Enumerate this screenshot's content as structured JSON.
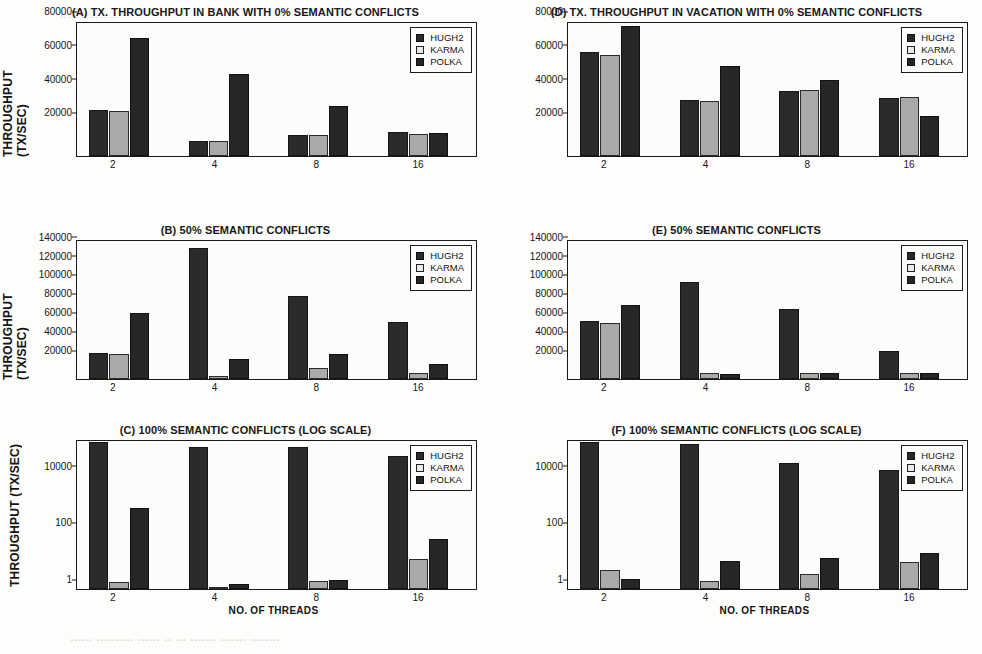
{
  "figure": {
    "series_names": [
      "HUGH2",
      "KARMA",
      "POLKA"
    ],
    "colors": {
      "hugh2": "#2b2b2b",
      "karma": "#a9a9a9",
      "polka": "#262626"
    },
    "x_axis_title": "NO. OF THREADS",
    "y_axis_title": "THROUGHPUT (TX/SEC)",
    "categories": [
      "2",
      "4",
      "8",
      "16"
    ]
  },
  "artifacts": {
    "top_left": "i. ....v. ... .. ...",
    "top_right": ".. ....... ........ ... ...",
    "bottom": "...... .......... ...... .. ... ....... ....... ........"
  },
  "chart_data": [
    {
      "id": "A",
      "type": "bar",
      "title": "(A) TX. THROUGHPUT IN BANK WITH 0% SEMANTIC CONFLICTS",
      "xlabel": "",
      "ylabel": "THROUGHPUT (TX/SEC)",
      "categories": [
        "2",
        "4",
        "8",
        "16"
      ],
      "yticks": [
        20000,
        40000,
        60000,
        80000
      ],
      "ytick_labels": [
        "20000",
        "40000",
        "60000",
        "80000"
      ],
      "ylim": [
        0,
        80000
      ],
      "scale": "linear",
      "grid": false,
      "legend": [
        "HUGH2",
        "KARMA",
        "POLKA"
      ],
      "legend_position": "top-right",
      "series": [
        {
          "name": "HUGH2",
          "values": [
            27500,
            8800,
            12500,
            14500
          ]
        },
        {
          "name": "KARMA",
          "values": [
            27300,
            8800,
            12700,
            13200
          ]
        },
        {
          "name": "POLKA",
          "values": [
            71000,
            49500,
            30000,
            13800
          ]
        }
      ]
    },
    {
      "id": "D",
      "type": "bar",
      "title": "(D) TX. THROUGHPUT IN VACATION WITH 0% SEMANTIC CONFLICTS",
      "xlabel": "",
      "ylabel": "",
      "categories": [
        "2",
        "4",
        "8",
        "16"
      ],
      "yticks": [
        20000,
        40000,
        60000,
        80000
      ],
      "ytick_labels": [
        "20000",
        "40000",
        "60000",
        "80000"
      ],
      "ylim": [
        0,
        80000
      ],
      "scale": "linear",
      "grid": false,
      "legend": [
        "HUGH2",
        "KARMA",
        "POLKA"
      ],
      "legend_position": "top-right",
      "series": [
        {
          "name": "HUGH2",
          "values": [
            62500,
            33500,
            39000,
            34800
          ]
        },
        {
          "name": "KARMA",
          "values": [
            60500,
            33000,
            40000,
            35200
          ]
        },
        {
          "name": "POLKA",
          "values": [
            78500,
            54000,
            45500,
            24000
          ]
        }
      ]
    },
    {
      "id": "B",
      "type": "bar",
      "title": "(B) 50% SEMANTIC CONFLICTS",
      "xlabel": "",
      "ylabel": "THROUGHPUT (TX/SEC)",
      "categories": [
        "2",
        "4",
        "8",
        "16"
      ],
      "yticks": [
        20000,
        40000,
        60000,
        80000,
        100000,
        120000,
        140000
      ],
      "ytick_labels": [
        "20000",
        "40000",
        "60000",
        "80000",
        "100000",
        "120000",
        "140000"
      ],
      "ylim": [
        0,
        148000
      ],
      "scale": "linear",
      "grid": false,
      "legend": [
        "HUGH2",
        "KARMA",
        "POLKA"
      ],
      "legend_position": "top-right",
      "series": [
        {
          "name": "HUGH2",
          "values": [
            27500,
            141000,
            88500,
            61500
          ]
        },
        {
          "name": "KARMA",
          "values": [
            26500,
            3500,
            11500,
            6500
          ]
        },
        {
          "name": "POLKA",
          "values": [
            70500,
            21000,
            26500,
            16000
          ]
        }
      ]
    },
    {
      "id": "E",
      "type": "bar",
      "title": "(E) 50% SEMANTIC CONFLICTS",
      "xlabel": "",
      "ylabel": "",
      "categories": [
        "2",
        "4",
        "8",
        "16"
      ],
      "yticks": [
        20000,
        40000,
        60000,
        80000,
        100000,
        120000,
        140000
      ],
      "ytick_labels": [
        "20000",
        "40000",
        "60000",
        "80000",
        "100000",
        "120000",
        "140000"
      ],
      "ylim": [
        0,
        148000
      ],
      "scale": "linear",
      "grid": false,
      "legend": [
        "HUGH2",
        "KARMA",
        "POLKA"
      ],
      "legend_position": "top-right",
      "series": [
        {
          "name": "HUGH2",
          "values": [
            62500,
            104500,
            75500,
            30500
          ]
        },
        {
          "name": "KARMA",
          "values": [
            60500,
            6000,
            6000,
            6000
          ]
        },
        {
          "name": "POLKA",
          "values": [
            79000,
            5500,
            6500,
            6500
          ]
        }
      ]
    },
    {
      "id": "C",
      "type": "bar",
      "title": "(C) 100% SEMANTIC CONFLICTS (LOG SCALE)",
      "xlabel": "NO. OF THREADS",
      "ylabel": "THROUGHPUT (TX/SEC)",
      "categories": [
        "2",
        "4",
        "8",
        "16"
      ],
      "yticks": [
        1,
        100,
        10000
      ],
      "ytick_labels": [
        "1",
        "100",
        "10000"
      ],
      "ylim": [
        1,
        200000
      ],
      "scale": "log",
      "grid": false,
      "legend": [
        "HUGH2",
        "KARMA",
        "POLKA"
      ],
      "legend_position": "top-right",
      "series": [
        {
          "name": "HUGH2",
          "values": [
            190000,
            120000,
            120000,
            60000
          ]
        },
        {
          "name": "KARMA",
          "values": [
            1.8,
            1.2,
            2.0,
            12.0
          ]
        },
        {
          "name": "POLKA",
          "values": [
            800,
            1.5,
            2.1,
            62.0
          ]
        }
      ]
    },
    {
      "id": "F",
      "type": "bar",
      "title": "(F) 100% SEMANTIC CONFLICTS (LOG SCALE)",
      "xlabel": "NO. OF THREADS",
      "ylabel": "",
      "categories": [
        "2",
        "4",
        "8",
        "16"
      ],
      "yticks": [
        1,
        100,
        10000
      ],
      "ytick_labels": [
        "1",
        "100",
        "10000"
      ],
      "ylim": [
        1,
        200000
      ],
      "scale": "log",
      "grid": false,
      "legend": [
        "HUGH2",
        "KARMA",
        "POLKA"
      ],
      "legend_position": "top-right",
      "series": [
        {
          "name": "HUGH2",
          "values": [
            190000,
            160000,
            32000,
            18000
          ]
        },
        {
          "name": "KARMA",
          "values": [
            5.0,
            2.0,
            3.5,
            9.5
          ]
        },
        {
          "name": "POLKA",
          "values": [
            2.3,
            10.0,
            13.0,
            19.0
          ]
        }
      ]
    }
  ]
}
